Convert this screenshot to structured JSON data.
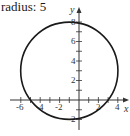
{
  "title": "radius: 5",
  "chart_data": {
    "type": "line",
    "title": "radius: 5",
    "xlabel": "x",
    "ylabel": "y",
    "xlim": [
      -7,
      5
    ],
    "ylim": [
      -3,
      9
    ],
    "x_ticks": [
      -6,
      -4,
      -2,
      2,
      4
    ],
    "y_ticks": [
      -2,
      2,
      4,
      6,
      8
    ],
    "grid": false,
    "series": [
      {
        "name": "circle",
        "shape": "circle",
        "center": [
          -1,
          3
        ],
        "radius": 5
      }
    ]
  },
  "axes": {
    "x_label": "x",
    "y_label": "y",
    "x_tick_labels": [
      "-6",
      "-4",
      "-2",
      "2",
      "4"
    ],
    "y_tick_labels": [
      "8",
      "6",
      "4",
      "2",
      "-2"
    ]
  }
}
